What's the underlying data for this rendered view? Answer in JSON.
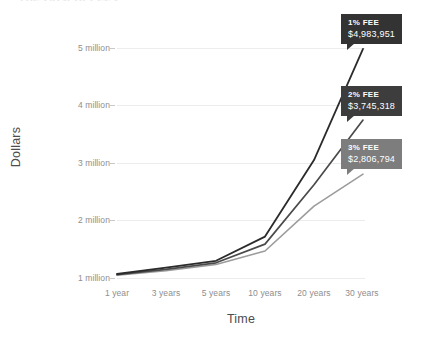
{
  "title": "The Cost of Fees",
  "chart_data": {
    "type": "line",
    "title": "The Cost of Fees",
    "xlabel": "Time",
    "ylabel": "Dollars",
    "categories": [
      "1 year",
      "3 years",
      "5 years",
      "10 years",
      "20 years",
      "30 years"
    ],
    "ytick_labels": [
      "1 million",
      "2 million",
      "3 million",
      "4 million",
      "5 million"
    ],
    "ytick_values": [
      1000000,
      2000000,
      3000000,
      4000000,
      5000000
    ],
    "ylim": [
      1000000,
      5200000
    ],
    "grid": true,
    "legend": "none",
    "series": [
      {
        "name": "1% FEE",
        "color": "#2b2b2b",
        "values": [
          1070000,
          1180000,
          1300000,
          1720000,
          3050000,
          4983951
        ],
        "end_label": "1% FEE",
        "end_value": "$4,983,951"
      },
      {
        "name": "2% FEE",
        "color": "#4a4a4a",
        "values": [
          1060000,
          1150000,
          1265000,
          1590000,
          2620000,
          3745318
        ],
        "end_label": "2% FEE",
        "end_value": "$3,745,318"
      },
      {
        "name": "3% FEE",
        "color": "#9c9c9c",
        "values": [
          1050000,
          1125000,
          1235000,
          1470000,
          2250000,
          2806794
        ],
        "end_label": "3% FEE",
        "end_value": "$2,806,794"
      }
    ],
    "annotations": [
      {
        "label": "1% FEE",
        "value": "$4,983,951",
        "box_color": "#333333",
        "text_color": "#ffffff"
      },
      {
        "label": "2% FEE",
        "value": "$3,745,318",
        "box_color": "#3d3d3d",
        "text_color": "#ffffff"
      },
      {
        "label": "3% FEE",
        "value": "$2,806,794",
        "box_color": "#7d7d7d",
        "text_color": "#ffffff"
      }
    ],
    "colors": {
      "gridline": "#ececec",
      "tick_text": "#8e8e8e",
      "axis_title": "#4d4d4d",
      "background": "#ffffff"
    }
  }
}
